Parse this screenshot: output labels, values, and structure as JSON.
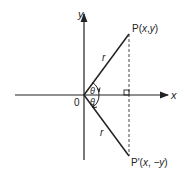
{
  "diagram": {
    "axes": {
      "x_label": "x",
      "y_label": "y",
      "origin_label": "0"
    },
    "points": {
      "p": {
        "prefix": "P(",
        "x": "x",
        "sep": ",",
        "y": "y",
        "suffix": ")"
      },
      "p_prime": {
        "prefix": "P'(",
        "x": "x",
        "sep": ", ",
        "y": "−y",
        "suffix": ")"
      }
    },
    "segments": {
      "upper_radius_label": "r",
      "lower_radius_label": "r"
    },
    "angles": {
      "upper_label": "θ",
      "lower_label": "θ"
    },
    "colors": {
      "line": "#222222",
      "background": "#ffffff"
    }
  }
}
